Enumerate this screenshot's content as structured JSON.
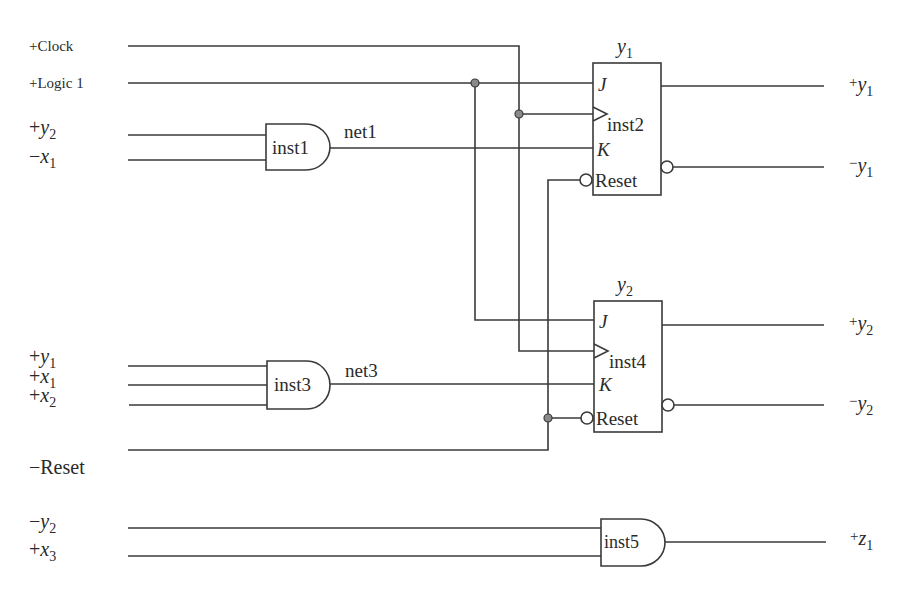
{
  "diagram": {
    "type": "logic-circuit",
    "inputs": {
      "clock": "+Clock",
      "logic1": "+Logic 1",
      "y2_pos": {
        "sign": "+",
        "var": "y",
        "sub": "2"
      },
      "x1_neg": {
        "sign": "−",
        "var": "x",
        "sub": "1"
      },
      "y1_pos": {
        "sign": "+",
        "var": "y",
        "sub": "1"
      },
      "x1_pos": {
        "sign": "+",
        "var": "x",
        "sub": "1"
      },
      "x2_pos": {
        "sign": "+",
        "var": "x",
        "sub": "2"
      },
      "reset_neg": "−Reset",
      "y2_neg": {
        "sign": "−",
        "var": "y",
        "sub": "2"
      },
      "x3_pos": {
        "sign": "+",
        "var": "x",
        "sub": "3"
      }
    },
    "outputs": {
      "y1_pos": {
        "sign": "+",
        "var": "y",
        "sub": "1"
      },
      "y1_neg": {
        "sign": "−",
        "var": "y",
        "sub": "1"
      },
      "y2_pos": {
        "sign": "+",
        "var": "y",
        "sub": "2"
      },
      "y2_neg": {
        "sign": "−",
        "var": "y",
        "sub": "2"
      },
      "z1_pos": {
        "sign": "+",
        "var": "z",
        "sub": "1"
      }
    },
    "gates": {
      "inst1": {
        "label": "inst1",
        "type": "AND",
        "net": "net1"
      },
      "inst3": {
        "label": "inst3",
        "type": "AND",
        "net": "net3"
      },
      "inst5": {
        "label": "inst5",
        "type": "AND"
      }
    },
    "flipflops": {
      "inst2": {
        "label": "inst2",
        "title_var": "y",
        "title_sub": "1",
        "pin_j": "J",
        "pin_k": "K",
        "pin_reset": "Reset"
      },
      "inst4": {
        "label": "inst4",
        "title_var": "y",
        "title_sub": "2",
        "pin_j": "J",
        "pin_k": "K",
        "pin_reset": "Reset"
      }
    }
  }
}
